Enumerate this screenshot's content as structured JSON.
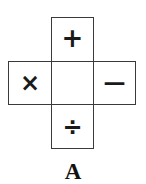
{
  "net": {
    "faces": [
      {
        "position": "top",
        "symbol": "+",
        "name": "plus"
      },
      {
        "position": "left",
        "symbol": "×",
        "name": "times"
      },
      {
        "position": "center",
        "symbol": "",
        "name": "blank"
      },
      {
        "position": "right",
        "symbol": "—",
        "name": "minus"
      },
      {
        "position": "bottom",
        "symbol": "÷",
        "name": "divide"
      }
    ],
    "label": "A"
  }
}
